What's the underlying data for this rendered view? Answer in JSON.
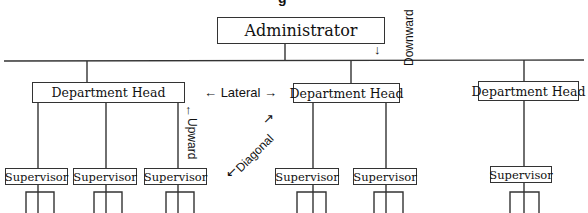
{
  "title_fragment": "g",
  "administrator": {
    "label": "Administrator"
  },
  "department_heads": [
    {
      "label": "Department Head"
    },
    {
      "label": "Department Head"
    },
    {
      "label": "Department Head"
    }
  ],
  "supervisors": [
    {
      "label": "Supervisor"
    },
    {
      "label": "Supervisor"
    },
    {
      "label": "Supervisor"
    },
    {
      "label": "Supervisor"
    },
    {
      "label": "Supervisor"
    },
    {
      "label": "Supervisor"
    }
  ],
  "flows": {
    "downward": "Downward",
    "upward": "Upward",
    "lateral": "Lateral",
    "diagonal": "Diagonal"
  },
  "arrows": {
    "left": "←",
    "right": "→",
    "up": "↑",
    "down": "↓",
    "up_right": "↗",
    "down_left": "↙"
  },
  "colors": {
    "line": "#333333",
    "text": "#111111",
    "background": "#ffffff"
  }
}
